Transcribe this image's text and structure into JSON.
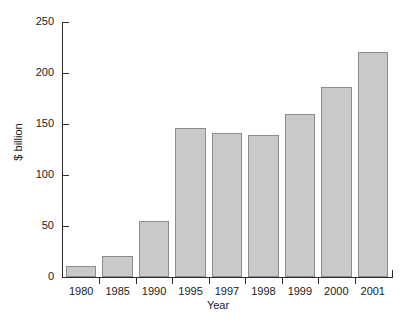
{
  "chart_data": {
    "type": "bar",
    "title": "",
    "subtitle": "",
    "xlabel": "Year",
    "ylabel": "$ billion",
    "categories": [
      "1980",
      "1985",
      "1990",
      "1995",
      "1997",
      "1998",
      "1999",
      "2000",
      "2001"
    ],
    "values": [
      11,
      21,
      55,
      146,
      141,
      139,
      160,
      186,
      221
    ],
    "ylim": [
      0,
      250
    ],
    "yticks": [
      0,
      50,
      100,
      150,
      200,
      250
    ],
    "ytick_labels": [
      "0",
      "50",
      "100",
      "150",
      "200",
      "250"
    ],
    "xtick_labels": [
      "1980",
      "1985",
      "1990",
      "1995",
      "1997",
      "1998",
      "1999",
      "2000",
      "2001"
    ],
    "grid": false,
    "legend": null,
    "legend_position": "none",
    "series": [
      {
        "name": "$ billion",
        "values": [
          11,
          21,
          55,
          146,
          141,
          139,
          160,
          186,
          221
        ]
      }
    ],
    "colors": {
      "bar_fill": "#c9c9c9",
      "bar_border": "#8c8c8c",
      "axis": "#2b2b2b",
      "text": "#1a1a1a",
      "background": "#ffffff"
    }
  }
}
